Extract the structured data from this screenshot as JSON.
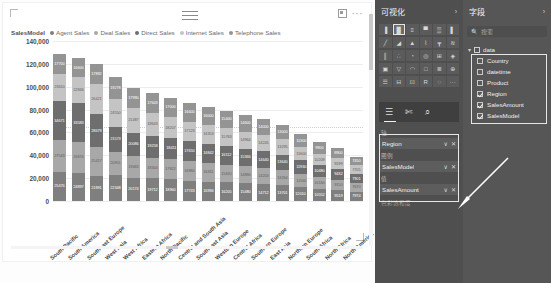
{
  "chart_data": {
    "type": "bar",
    "subtype": "stacked-column",
    "title": "",
    "xlabel": "",
    "ylabel": "",
    "ylim": [
      0,
      140000
    ],
    "ytick_step": 20000,
    "ytick_labels": [
      "140,000",
      "120,000",
      "100,000",
      "80,000",
      "60,000",
      "40,000",
      "20,000",
      "0"
    ],
    "grid": true,
    "legend_title": "SalesModel",
    "legend_position": "top",
    "reference_line": 65000,
    "series": [
      {
        "name": "Agent Sales",
        "color": "#7f7f7f"
      },
      {
        "name": "Deal Sales",
        "color": "#a8a8a8"
      },
      {
        "name": "Direct Sales",
        "color": "#6e6e6e"
      },
      {
        "name": "Internet Sales",
        "color": "#c4c4c4"
      },
      {
        "name": "Telephone Sales",
        "color": "#949494"
      }
    ],
    "categories": [
      "South Pacific",
      "South America",
      "Southeast Europe",
      "West Asia",
      "West Africa",
      "Eastern Africa",
      "North Pacific",
      "Central and South Asia",
      "Southeast Asia",
      "Western Europe",
      "Central Africa",
      "Southern Europe",
      "East Asia",
      "Northern Europe",
      "South Africa",
      "North Africa",
      "North America"
    ],
    "bars": [
      {
        "category": "South Pacific",
        "total": 129000,
        "segments": [
          25476,
          27543,
          34671,
          23610,
          17700
        ]
      },
      {
        "category": "South America",
        "total": 124800,
        "segments": [
          24897,
          26874,
          33583,
          22846,
          16600
        ]
      },
      {
        "category": "Southeast Europe",
        "total": 120300,
        "segments": [
          21891,
          25417,
          28679,
          26421,
          17892
        ]
      },
      {
        "category": "West Asia",
        "total": 108700,
        "segments": [
          22348,
          20951,
          21573,
          24550,
          19278
        ]
      },
      {
        "category": "West Africa",
        "total": 99200,
        "segments": [
          20174,
          19463,
          20086,
          21487,
          17990
        ]
      },
      {
        "category": "Eastern Africa",
        "total": 94600,
        "segments": [
          19712,
          18344,
          19258,
          19643,
          17643
        ]
      },
      {
        "category": "North Pacific",
        "total": 90400,
        "segments": [
          18960,
          17822,
          18411,
          18207,
          17000
        ]
      },
      {
        "category": "Central and South Asia",
        "total": 86100,
        "segments": [
          17743,
          16984,
          17650,
          17123,
          16600
        ]
      },
      {
        "category": "Southeast Asia",
        "total": 82500,
        "segments": [
          16994,
          16311,
          16842,
          16353,
          16000
        ]
      },
      {
        "category": "Western Europe",
        "total": 79100,
        "segments": [
          16205,
          15620,
          16112,
          15763,
          15400
        ]
      },
      {
        "category": "Central Africa",
        "total": 75300,
        "segments": [
          15480,
          14890,
          15366,
          14964,
          14600
        ]
      },
      {
        "category": "Southern Europe",
        "total": 71800,
        "segments": [
          14712,
          14203,
          14640,
          14245,
          14000
        ]
      },
      {
        "category": "East Asia",
        "total": 66900,
        "segments": [
          13701,
          13264,
          13640,
          13295,
          13000
        ]
      },
      {
        "category": "Northern Europe",
        "total": 58400,
        "segments": [
          12010,
          11560,
          11930,
          11600,
          11300
        ]
      },
      {
        "category": "South Africa",
        "total": 51300,
        "segments": [
          10552,
          10160,
          10480,
          10208,
          9900
        ]
      },
      {
        "category": "North Africa",
        "total": 46200,
        "segments": [
          9519,
          9150,
          9432,
          9199,
          8900
        ]
      },
      {
        "category": "North America",
        "total": 38700,
        "segments": [
          7974,
          7670,
          7901,
          7705,
          7450
        ]
      }
    ]
  },
  "card": {
    "hamburger_icon": "hamburger-icon",
    "focus_icon": "focus-mode-icon",
    "more_label": "···"
  },
  "viz_pane": {
    "title": "可视化",
    "collapse_chevron": "›",
    "icons": [
      "stacked-bar-chart-icon",
      "stacked-column-chart-icon",
      "clustered-bar-chart-icon",
      "clustered-column-chart-icon",
      "100-stacked-bar-icon",
      "100-stacked-column-icon",
      "line-chart-icon",
      "area-chart-icon",
      "stacked-area-icon",
      "line-stacked-column-icon",
      "line-clustered-column-icon",
      "ribbon-chart-icon",
      "waterfall-chart-icon",
      "scatter-chart-icon",
      "pie-chart-icon",
      "donut-chart-icon",
      "treemap-icon",
      "map-icon",
      "filled-map-icon",
      "funnel-icon",
      "gauge-icon",
      "card-icon",
      "multi-row-card-icon",
      "kpi-icon",
      "slicer-icon",
      "table-icon",
      "matrix-icon",
      "r-script-icon",
      "python-script-icon",
      "more-visuals-icon"
    ],
    "selected_icon_index": 1,
    "tabs": [
      {
        "name": "fields-tab",
        "glyph": "☰",
        "active": true
      },
      {
        "name": "format-tab",
        "glyph": "✄"
      },
      {
        "name": "analytics-tab",
        "glyph": "⌕"
      }
    ],
    "wells": [
      {
        "label": "轴",
        "name": "axis-well",
        "field": "Region",
        "filter_glyph": "∨",
        "remove_glyph": "✕"
      },
      {
        "label": "图例",
        "name": "legend-well",
        "field": "SalesModel",
        "filter_glyph": "∨",
        "remove_glyph": "✕"
      },
      {
        "label": "值",
        "name": "values-well",
        "field": "SalesAmount",
        "filter_glyph": "∨",
        "remove_glyph": "✕"
      }
    ],
    "wells_footer": "色彩饱和度"
  },
  "fields_pane": {
    "title": "字段",
    "collapse_chevron": "›",
    "search_icon": "search-icon",
    "search_placeholder": "搜索",
    "search_value": "",
    "table_name": "data",
    "expand_glyph": "▾",
    "fields": [
      {
        "name": "Country",
        "checked": false
      },
      {
        "name": "datetime",
        "checked": false
      },
      {
        "name": "Product",
        "checked": false
      },
      {
        "name": "Region",
        "checked": true
      },
      {
        "name": "SalesAmount",
        "checked": true
      },
      {
        "name": "SalesModel",
        "checked": true
      }
    ]
  },
  "annotation": {
    "arrow_name": "callout-arrow"
  }
}
